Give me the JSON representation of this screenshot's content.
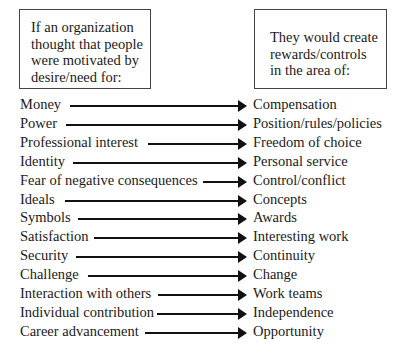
{
  "left_box": {
    "lines": [
      "If an organization",
      "thought that people",
      "were motivated by",
      "desire/need for:"
    ]
  },
  "right_box": {
    "lines": [
      "They would create",
      "rewards/controls",
      "in the area of:"
    ]
  },
  "rows": [
    {
      "need": "Money",
      "reward": "Compensation",
      "arrow_start": 70
    },
    {
      "need": "Power",
      "reward": "Position/rules/policies",
      "arrow_start": 66
    },
    {
      "need": "Professional interest",
      "reward": "Freedom of choice",
      "arrow_start": 148
    },
    {
      "need": "Identity",
      "reward": "Personal service",
      "arrow_start": 73
    },
    {
      "need": "Fear of negative consequences",
      "reward": "Control/conflict",
      "arrow_start": 203
    },
    {
      "need": "Ideals",
      "reward": "Concepts",
      "arrow_start": 65
    },
    {
      "need": "Symbols",
      "reward": "Awards",
      "arrow_start": 78
    },
    {
      "need": "Satisfaction",
      "reward": "Interesting work",
      "arrow_start": 94
    },
    {
      "need": "Security",
      "reward": "Continuity",
      "arrow_start": 76
    },
    {
      "need": "Challenge",
      "reward": "Change",
      "arrow_start": 88
    },
    {
      "need": "Interaction with others",
      "reward": "Work teams",
      "arrow_start": 158
    },
    {
      "need": "Individual contribution",
      "reward": "Independence",
      "arrow_start": 157
    },
    {
      "need": "Career advancement",
      "reward": "Opportunity",
      "arrow_start": 145
    }
  ]
}
